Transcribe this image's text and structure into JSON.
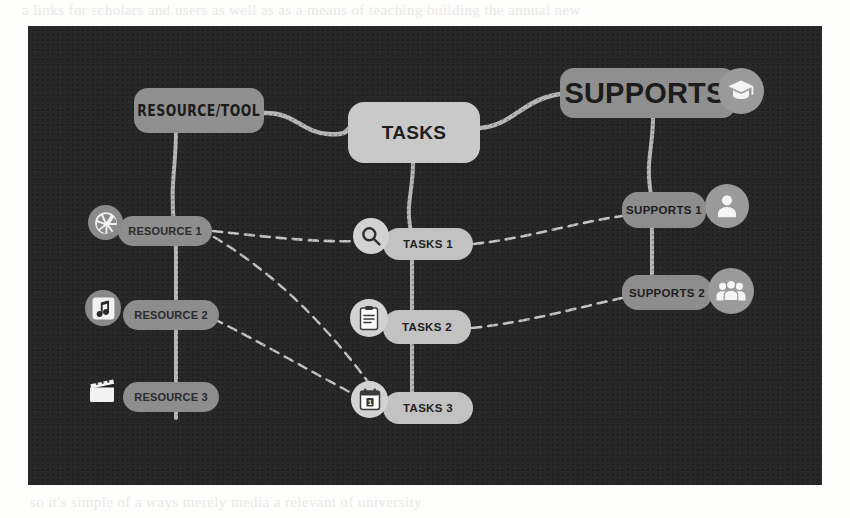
{
  "page": {
    "ghost_top": "a links for scholars and users as well as as a means of teaching  building the annual new",
    "ghost_bottom": "so it's simple of a  ways  merely  media  a  relevant  of  university"
  },
  "diagram": {
    "background_color": "#272727",
    "branches": [
      {
        "id": "resource-tool",
        "label": "RESOURCE/TOOL",
        "color": "#8f8f8f",
        "children": [
          {
            "id": "resource-1",
            "label": "RESOURCE 1",
            "icon": "aperture-icon"
          },
          {
            "id": "resource-2",
            "label": "RESOURCE 2",
            "icon": "music-note-icon"
          },
          {
            "id": "resource-3",
            "label": "RESOURCE 3",
            "icon": "clapperboard-icon"
          }
        ]
      },
      {
        "id": "tasks",
        "label": "TASKS",
        "color": "#c9c9c9",
        "children": [
          {
            "id": "tasks-1",
            "label": "TASKS 1",
            "icon": "search-icon"
          },
          {
            "id": "tasks-2",
            "label": "TASKS 2",
            "icon": "clipboard-icon"
          },
          {
            "id": "tasks-3",
            "label": "TASKS 3",
            "icon": "calendar-icon"
          }
        ]
      },
      {
        "id": "supports",
        "label": "SUPPORTS",
        "color": "#8f8f8f",
        "icon": "graduation-cap-icon",
        "children": [
          {
            "id": "supports-1",
            "label": "SUPPORTS 1",
            "icon": "person-icon"
          },
          {
            "id": "supports-2",
            "label": "SUPPORTS 2",
            "icon": "people-group-icon"
          }
        ]
      }
    ],
    "links": [
      {
        "from": "resource-tool",
        "to": "tasks",
        "style": "solid"
      },
      {
        "from": "tasks",
        "to": "supports",
        "style": "solid"
      },
      {
        "from": "resource-tool",
        "to": "resource-1",
        "style": "solid"
      },
      {
        "from": "resource-1",
        "to": "resource-2",
        "style": "solid"
      },
      {
        "from": "resource-2",
        "to": "resource-3",
        "style": "solid"
      },
      {
        "from": "tasks",
        "to": "tasks-1",
        "style": "solid"
      },
      {
        "from": "tasks-1",
        "to": "tasks-2",
        "style": "solid"
      },
      {
        "from": "tasks-2",
        "to": "tasks-3",
        "style": "solid"
      },
      {
        "from": "supports",
        "to": "supports-1",
        "style": "solid"
      },
      {
        "from": "supports-1",
        "to": "supports-2",
        "style": "solid"
      },
      {
        "from": "resource-1",
        "to": "tasks-1",
        "style": "dashed"
      },
      {
        "from": "resource-1",
        "to": "tasks-3",
        "style": "dashed"
      },
      {
        "from": "resource-2",
        "to": "tasks-3",
        "style": "dashed"
      },
      {
        "from": "tasks-1",
        "to": "supports-1",
        "style": "dashed"
      },
      {
        "from": "tasks-2",
        "to": "supports-2",
        "style": "dashed"
      }
    ]
  }
}
